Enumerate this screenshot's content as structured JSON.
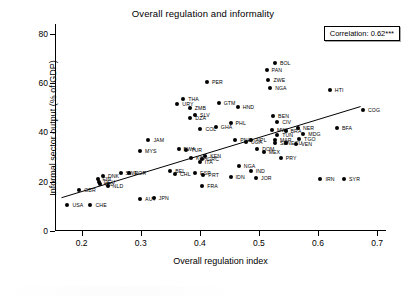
{
  "chart_data": {
    "type": "scatter",
    "title": "Overall regulation and informality",
    "xlabel": "Overall regulation index",
    "ylabel": "Informal sector output (% of GDP)",
    "xlim": [
      0.155,
      0.715
    ],
    "ylim": [
      0,
      84
    ],
    "xticks": [
      "0.2",
      "0.3",
      "0.4",
      "0.5",
      "0.6",
      "0.7"
    ],
    "xtick_values": [
      0.2,
      0.3,
      0.4,
      0.5,
      0.6,
      0.7
    ],
    "yticks": [
      "0",
      "20",
      "40",
      "60",
      "80"
    ],
    "ytick_values": [
      0,
      20,
      40,
      60,
      80
    ],
    "grid": false,
    "annotation": "Correlation: 0.62***",
    "fit_line": {
      "x0": 0.166,
      "y0": 13.5,
      "x1": 0.672,
      "y1": 50.5
    },
    "point_labels": true,
    "points": [
      {
        "label": "BOL",
        "x": 0.527,
        "y": 68.0,
        "lx": 5
      },
      {
        "label": "PAN",
        "x": 0.513,
        "y": 65.2,
        "lx": 5
      },
      {
        "label": "ZWE",
        "x": 0.516,
        "y": 61.2,
        "lx": 5
      },
      {
        "label": "PER",
        "x": 0.412,
        "y": 60.4,
        "lx": 5
      },
      {
        "label": "NGA",
        "x": 0.519,
        "y": 58.2,
        "lx": 5
      },
      {
        "label": "HTI",
        "x": 0.62,
        "y": 57.2,
        "lx": 5
      },
      {
        "label": "THA",
        "x": 0.372,
        "y": 53.4,
        "lx": 5
      },
      {
        "label": "GTM",
        "x": 0.432,
        "y": 52.0,
        "lx": 5
      },
      {
        "label": "URY",
        "x": 0.362,
        "y": 51.6,
        "lx": 5
      },
      {
        "label": "COG",
        "x": 0.676,
        "y": 49.0,
        "lx": 5
      },
      {
        "label": "HND",
        "x": 0.464,
        "y": 50.2,
        "lx": 5
      },
      {
        "label": "ZMB",
        "x": 0.383,
        "y": 49.8,
        "lx": 5
      },
      {
        "label": "SLV",
        "x": 0.392,
        "y": 46.9,
        "lx": 5
      },
      {
        "label": "DZA",
        "x": 0.384,
        "y": 45.8,
        "lx": 5
      },
      {
        "label": "BEN",
        "x": 0.524,
        "y": 46.7,
        "lx": 5
      },
      {
        "label": "CIV",
        "x": 0.531,
        "y": 44.2,
        "lx": 5
      },
      {
        "label": "PHL",
        "x": 0.452,
        "y": 44.0,
        "lx": 5
      },
      {
        "label": "GHA",
        "x": 0.427,
        "y": 42.2,
        "lx": 5
      },
      {
        "label": "COL",
        "x": 0.401,
        "y": 41.3,
        "lx": 5
      },
      {
        "label": "NER",
        "x": 0.566,
        "y": 42.0,
        "lx": 5
      },
      {
        "label": "BFA",
        "x": 0.632,
        "y": 41.6,
        "lx": 5
      },
      {
        "label": "MWI",
        "x": 0.522,
        "y": 40.9,
        "lx": 5
      },
      {
        "label": "BRA",
        "x": 0.545,
        "y": 40.4,
        "lx": 5
      },
      {
        "label": "MDG",
        "x": 0.575,
        "y": 39.4,
        "lx": 5
      },
      {
        "label": "TUN",
        "x": 0.531,
        "y": 39.0,
        "lx": 5
      },
      {
        "label": "TGO",
        "x": 0.568,
        "y": 37.5,
        "lx": 5
      },
      {
        "label": "MAR",
        "x": 0.527,
        "y": 37.0,
        "lx": 5
      },
      {
        "label": "SEN",
        "x": 0.527,
        "y": 35.6,
        "lx": 5
      },
      {
        "label": "ECU",
        "x": 0.546,
        "y": 35.6,
        "lx": 5
      },
      {
        "label": "VEN",
        "x": 0.563,
        "y": 35.3,
        "lx": 5
      },
      {
        "label": "PNG",
        "x": 0.46,
        "y": 36.8,
        "lx": 5
      },
      {
        "label": "NPL",
        "x": 0.487,
        "y": 37.0,
        "lx": 5
      },
      {
        "label": "UGA",
        "x": 0.478,
        "y": 36.3,
        "lx": 5
      },
      {
        "label": "JAM",
        "x": 0.313,
        "y": 36.8,
        "lx": 5
      },
      {
        "label": "DOM",
        "x": 0.497,
        "y": 33.2,
        "lx": 5
      },
      {
        "label": "MEX",
        "x": 0.508,
        "y": 31.9,
        "lx": 5
      },
      {
        "label": "MYS",
        "x": 0.299,
        "y": 32.3,
        "lx": 5
      },
      {
        "label": "BWA",
        "x": 0.364,
        "y": 33.3,
        "lx": 5
      },
      {
        "label": "TUR",
        "x": 0.377,
        "y": 32.7,
        "lx": 5
      },
      {
        "label": "KEN",
        "x": 0.409,
        "y": 30.6,
        "lx": 5
      },
      {
        "label": "KOR",
        "x": 0.385,
        "y": 29.8,
        "lx": 5
      },
      {
        "label": "GRC",
        "x": 0.404,
        "y": 29.2,
        "lx": 5
      },
      {
        "label": "ITA",
        "x": 0.4,
        "y": 27.8,
        "lx": 5
      },
      {
        "label": "PRY",
        "x": 0.537,
        "y": 29.8,
        "lx": 5
      },
      {
        "label": "NGA2",
        "x": 0.466,
        "y": 26.5,
        "lx": 5
      },
      {
        "label": "IND",
        "x": 0.486,
        "y": 24.5,
        "lx": 5
      },
      {
        "label": "BEL",
        "x": 0.35,
        "y": 24.4,
        "lx": 5
      },
      {
        "label": "CHL",
        "x": 0.358,
        "y": 23.0,
        "lx": 5
      },
      {
        "label": "ESP",
        "x": 0.392,
        "y": 23.5,
        "lx": 5
      },
      {
        "label": "PRT",
        "x": 0.406,
        "y": 22.8,
        "lx": 5
      },
      {
        "label": "IDN",
        "x": 0.452,
        "y": 21.9,
        "lx": 5
      },
      {
        "label": "JOR",
        "x": 0.495,
        "y": 21.5,
        "lx": 5
      },
      {
        "label": "IRN",
        "x": 0.604,
        "y": 20.9,
        "lx": 5
      },
      {
        "label": "SYR",
        "x": 0.644,
        "y": 21.0,
        "lx": 5
      },
      {
        "label": "NOR",
        "x": 0.281,
        "y": 23.6,
        "lx": 5
      },
      {
        "label": "SWE",
        "x": 0.266,
        "y": 23.5,
        "lx": 5
      },
      {
        "label": "DNK",
        "x": 0.236,
        "y": 22.5,
        "lx": 5
      },
      {
        "label": "FIN",
        "x": 0.227,
        "y": 21.0,
        "lx": 5
      },
      {
        "label": "DEU",
        "x": 0.229,
        "y": 19.9,
        "lx": 5
      },
      {
        "label": "IRL",
        "x": 0.231,
        "y": 19.1,
        "lx": 5
      },
      {
        "label": "NLD",
        "x": 0.244,
        "y": 18.3,
        "lx": 5
      },
      {
        "label": "GBR",
        "x": 0.196,
        "y": 16.6,
        "lx": 5
      },
      {
        "label": "FRA",
        "x": 0.404,
        "y": 18.3,
        "lx": 5
      },
      {
        "label": "AUT",
        "x": 0.299,
        "y": 13.0,
        "lx": 5
      },
      {
        "label": "JPN",
        "x": 0.322,
        "y": 13.5,
        "lx": 5
      },
      {
        "label": "USA",
        "x": 0.176,
        "y": 10.5,
        "lx": 5
      },
      {
        "label": "CHE",
        "x": 0.215,
        "y": 10.5,
        "lx": 5
      }
    ]
  }
}
